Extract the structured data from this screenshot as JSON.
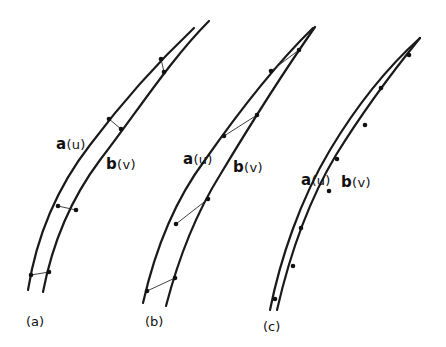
{
  "figure": {
    "panels": [
      {
        "id": "a",
        "label": "(a)",
        "curve_a": {
          "name": "a",
          "arg": "(u)"
        },
        "curve_b": {
          "name": "b",
          "arg": "(v)"
        },
        "correspondence": "nearest-point links between curves"
      },
      {
        "id": "b",
        "label": "(b)",
        "curve_a": {
          "name": "a",
          "arg": "(u)"
        },
        "curve_b": {
          "name": "b",
          "arg": "(v)"
        },
        "correspondence": "zig-zag links between curves"
      },
      {
        "id": "c",
        "label": "(c)",
        "curve_a": {
          "name": "a",
          "arg": "(u)"
        },
        "curve_b": {
          "name": "b",
          "arg": "(v)"
        },
        "correspondence": "curves nearly coincident with points along them"
      }
    ],
    "colors": {
      "ink": "#111111",
      "background": "#ffffff"
    }
  }
}
